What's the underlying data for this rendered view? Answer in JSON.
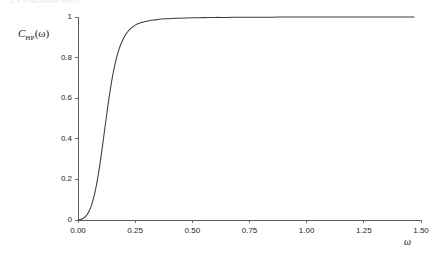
{
  "page": {
    "running_head": "5.4   Fractional filters"
  },
  "figure": {
    "ylabel_symbol": "C",
    "ylabel_subscript": "HP",
    "ylabel_argument": "(ω)",
    "xlabel": "ω"
  },
  "chart_data": {
    "type": "line",
    "title": "",
    "subtitle": "",
    "xlabel": "ω",
    "ylabel": "C_HP(ω)",
    "xlim": [
      0.0,
      1.5
    ],
    "ylim": [
      0.0,
      1.0
    ],
    "grid": false,
    "legend": false,
    "legend_position": "none",
    "xticks": [
      0.0,
      0.25,
      0.5,
      0.75,
      1.0,
      1.25,
      1.5
    ],
    "xtick_labels": [
      "0.00",
      "0.25",
      "0.50",
      "0.75",
      "1.00",
      "1.25",
      "1.50"
    ],
    "yticks": [
      0.0,
      0.2,
      0.4,
      0.6,
      0.8,
      1.0
    ],
    "ytick_labels": [
      "0",
      "0.2",
      "0.4",
      "0.6",
      "0.8",
      "1"
    ],
    "series": [
      {
        "name": "C_HP(ω)",
        "color": "#3c3c3c",
        "x": [
          0.0,
          0.01,
          0.02,
          0.03,
          0.04,
          0.05,
          0.06,
          0.07,
          0.08,
          0.09,
          0.1,
          0.11,
          0.12,
          0.13,
          0.14,
          0.15,
          0.16,
          0.17,
          0.18,
          0.19,
          0.2,
          0.21,
          0.22,
          0.23,
          0.24,
          0.25,
          0.27,
          0.29,
          0.31,
          0.33,
          0.35,
          0.38,
          0.41,
          0.44,
          0.47,
          0.5,
          0.55,
          0.6,
          0.65,
          0.7,
          0.75,
          0.8,
          0.85,
          0.9,
          0.95,
          1.0,
          1.1,
          1.2,
          1.3,
          1.4,
          1.47
        ],
        "y": [
          0.0,
          0.002,
          0.006,
          0.014,
          0.027,
          0.047,
          0.076,
          0.116,
          0.168,
          0.232,
          0.307,
          0.389,
          0.474,
          0.557,
          0.634,
          0.701,
          0.758,
          0.805,
          0.843,
          0.873,
          0.897,
          0.916,
          0.931,
          0.943,
          0.952,
          0.96,
          0.97,
          0.977,
          0.982,
          0.985,
          0.988,
          0.991,
          0.993,
          0.994,
          0.995,
          0.996,
          0.997,
          0.998,
          0.998,
          0.999,
          0.999,
          0.999,
          0.999,
          1.0,
          1.0,
          1.0,
          1.0,
          1.0,
          1.0,
          1.0,
          1.0
        ]
      }
    ]
  }
}
